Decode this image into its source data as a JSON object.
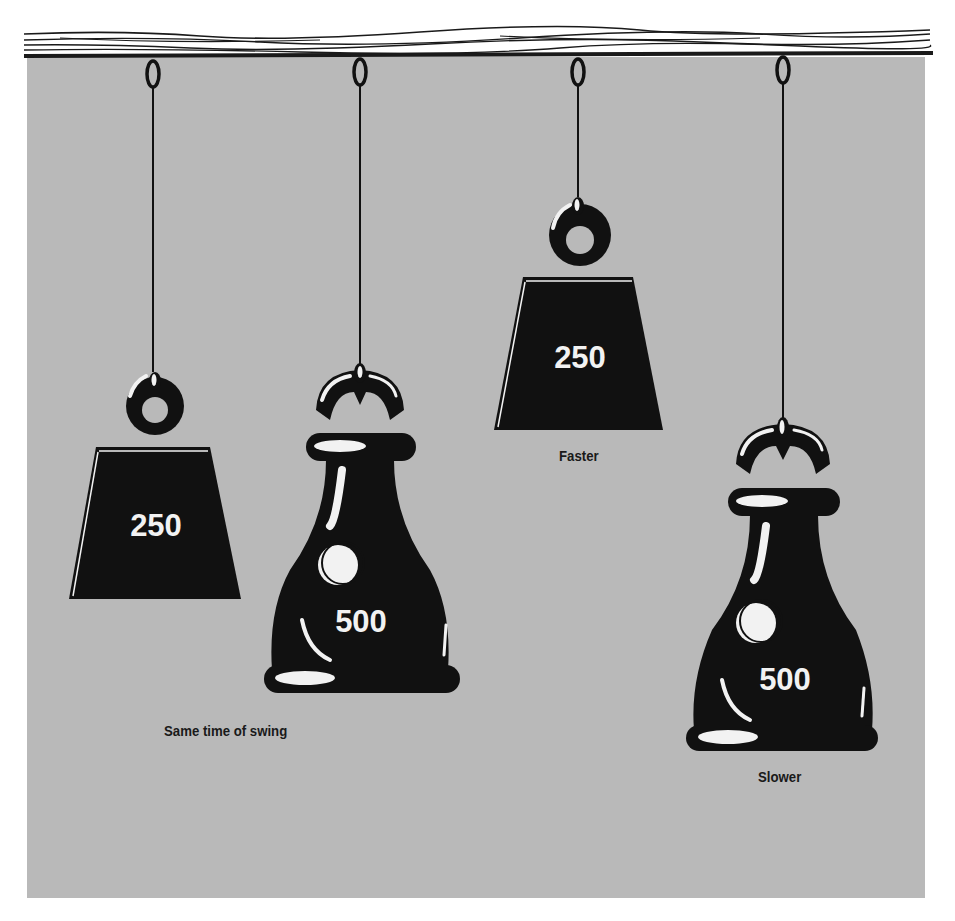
{
  "figure": {
    "colors": {
      "background": "#ffffff",
      "panel": "#b9b9b9",
      "ink": "#111111",
      "highlight": "#f2f2f2"
    }
  },
  "pendulums": [
    {
      "id": "p1",
      "shape": "block",
      "label": "250",
      "string_length": "short"
    },
    {
      "id": "p2",
      "shape": "bottle",
      "label": "500",
      "string_length": "short"
    },
    {
      "id": "p3",
      "shape": "block",
      "label": "250",
      "string_length": "shorter"
    },
    {
      "id": "p4",
      "shape": "bottle",
      "label": "500",
      "string_length": "longer"
    }
  ],
  "captions": {
    "same": "Same time of swing",
    "faster": "Faster",
    "slower": "Slower"
  }
}
